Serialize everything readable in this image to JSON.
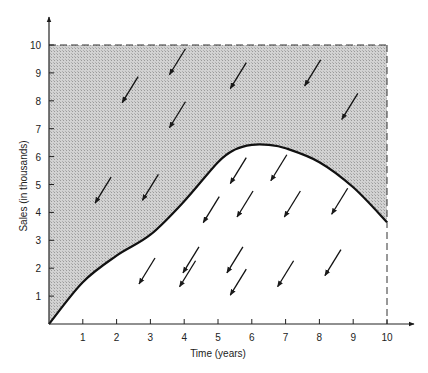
{
  "chart_data": {
    "type": "area",
    "title": "",
    "xlabel": "Time (years)",
    "ylabel": "Sales (in thousands)",
    "xlim": [
      0,
      10
    ],
    "ylim": [
      0,
      10
    ],
    "x_ticks": [
      1,
      2,
      3,
      4,
      5,
      6,
      7,
      8,
      9,
      10
    ],
    "y_ticks": [
      1,
      2,
      3,
      4,
      5,
      6,
      7,
      8,
      9,
      10
    ],
    "grid": false,
    "legend": null,
    "boundary": {
      "style": "dashed",
      "x_max": 10,
      "y_max": 10
    },
    "series": [
      {
        "name": "sales curve",
        "x": [
          0,
          1,
          2,
          3,
          4,
          5,
          5.5,
          6,
          6.5,
          7,
          8,
          9,
          10
        ],
        "y": [
          0,
          1.5,
          2.45,
          3.2,
          4.4,
          5.8,
          6.25,
          6.42,
          6.42,
          6.3,
          5.8,
          4.9,
          3.65
        ]
      }
    ],
    "regions": [
      {
        "name": "above-curve",
        "fill": "shaded",
        "bounds": "between curve and y=10"
      },
      {
        "name": "below-curve",
        "fill": "white",
        "bounds": "between x-axis and curve"
      }
    ],
    "annotations": {
      "direction_arrows": "all arrows point down-left",
      "arrows_above_curve": [
        {
          "x": 2.4,
          "y": 8.4
        },
        {
          "x": 3.8,
          "y": 9.4
        },
        {
          "x": 3.8,
          "y": 7.5
        },
        {
          "x": 5.6,
          "y": 8.9
        },
        {
          "x": 7.8,
          "y": 9.0
        },
        {
          "x": 8.9,
          "y": 7.8
        },
        {
          "x": 1.6,
          "y": 4.8
        },
        {
          "x": 3.0,
          "y": 4.9
        }
      ],
      "arrows_below_curve": [
        {
          "x": 5.6,
          "y": 5.5
        },
        {
          "x": 6.8,
          "y": 5.6
        },
        {
          "x": 4.8,
          "y": 4.1
        },
        {
          "x": 5.8,
          "y": 4.3
        },
        {
          "x": 7.2,
          "y": 4.3
        },
        {
          "x": 8.6,
          "y": 4.4
        },
        {
          "x": 4.2,
          "y": 2.3
        },
        {
          "x": 5.5,
          "y": 2.3
        },
        {
          "x": 2.9,
          "y": 1.9
        },
        {
          "x": 4.1,
          "y": 1.8
        },
        {
          "x": 5.6,
          "y": 1.5
        },
        {
          "x": 7.0,
          "y": 1.8
        },
        {
          "x": 8.4,
          "y": 2.2
        }
      ]
    }
  },
  "colors": {
    "shade": "#c8c8c8",
    "ink": "#1a1a1a",
    "background": "#ffffff"
  }
}
